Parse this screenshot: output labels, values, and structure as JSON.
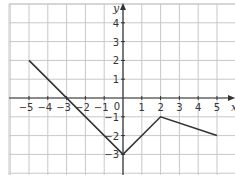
{
  "chart_data": {
    "type": "line",
    "title": "",
    "xlabel": "x",
    "ylabel": "y",
    "xlim": [
      -5.5,
      5.5
    ],
    "ylim": [
      -3.5,
      4.5
    ],
    "x_ticks": [
      -5,
      -4,
      -3,
      -2,
      -1,
      0,
      1,
      2,
      3,
      4,
      5
    ],
    "y_ticks": [
      -3,
      -2,
      -1,
      1,
      2,
      3,
      4
    ],
    "grid": true,
    "legend": null,
    "series": [
      {
        "name": "piecewise",
        "x": [
          -5,
          0,
          2,
          5
        ],
        "y": [
          2,
          -3,
          -1,
          -2
        ]
      }
    ]
  },
  "colors": {
    "grid": "#c8c8c8",
    "axis": "#333333",
    "line": "#333333"
  },
  "labels": {
    "y_axis": "y",
    "x_axis": "x",
    "origin": "0"
  }
}
